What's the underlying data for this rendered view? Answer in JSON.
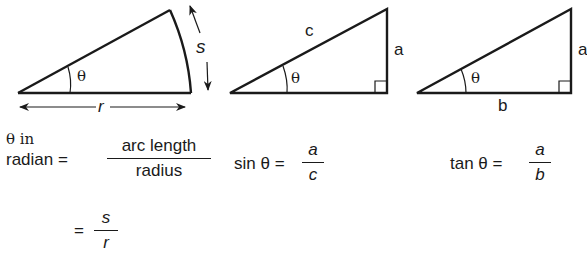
{
  "figures": [
    {
      "id": "radian-sector",
      "angle_label": "θ",
      "arc_label": "s",
      "radius_label": "r"
    },
    {
      "id": "sine-triangle",
      "angle_label": "θ",
      "hypotenuse_label": "c",
      "opposite_label": "a"
    },
    {
      "id": "tangent-triangle",
      "angle_label": "θ",
      "opposite_label": "a",
      "adjacent_label": "b"
    }
  ],
  "formulas": {
    "radian": {
      "line1": "θ in",
      "lhs": "radian =",
      "numerator": "arc length",
      "denominator": "radius",
      "eq2": "=",
      "numerator2": "s",
      "denominator2": "r"
    },
    "sine": {
      "lhs": "sin θ =",
      "numerator": "a",
      "denominator": "c"
    },
    "tangent": {
      "lhs": "tan θ =",
      "numerator": "a",
      "denominator": "b"
    }
  },
  "colors": {
    "ink": "#1a1a1a",
    "background": "#ffffff"
  }
}
